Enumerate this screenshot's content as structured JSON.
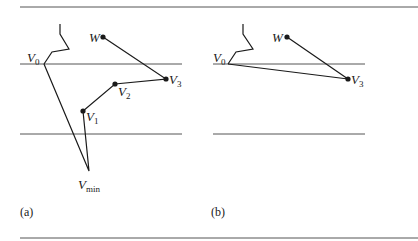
{
  "figure": {
    "panels": [
      {
        "id": "a",
        "caption": "(a)",
        "points": {
          "V0": {
            "label": "V",
            "sub": "0"
          },
          "W": {
            "label": "W",
            "sub": ""
          },
          "V3": {
            "label": "V",
            "sub": "3"
          },
          "V2": {
            "label": "V",
            "sub": "2"
          },
          "V1": {
            "label": "V",
            "sub": "1"
          },
          "Vmin": {
            "label": "V",
            "sub": "min"
          }
        }
      },
      {
        "id": "b",
        "caption": "(b)",
        "points": {
          "V0": {
            "label": "V",
            "sub": "0"
          },
          "W": {
            "label": "W",
            "sub": ""
          },
          "V3": {
            "label": "V",
            "sub": "3"
          }
        }
      }
    ],
    "colors": {
      "ink": "#1a1a1a",
      "rule": "#555555"
    }
  }
}
